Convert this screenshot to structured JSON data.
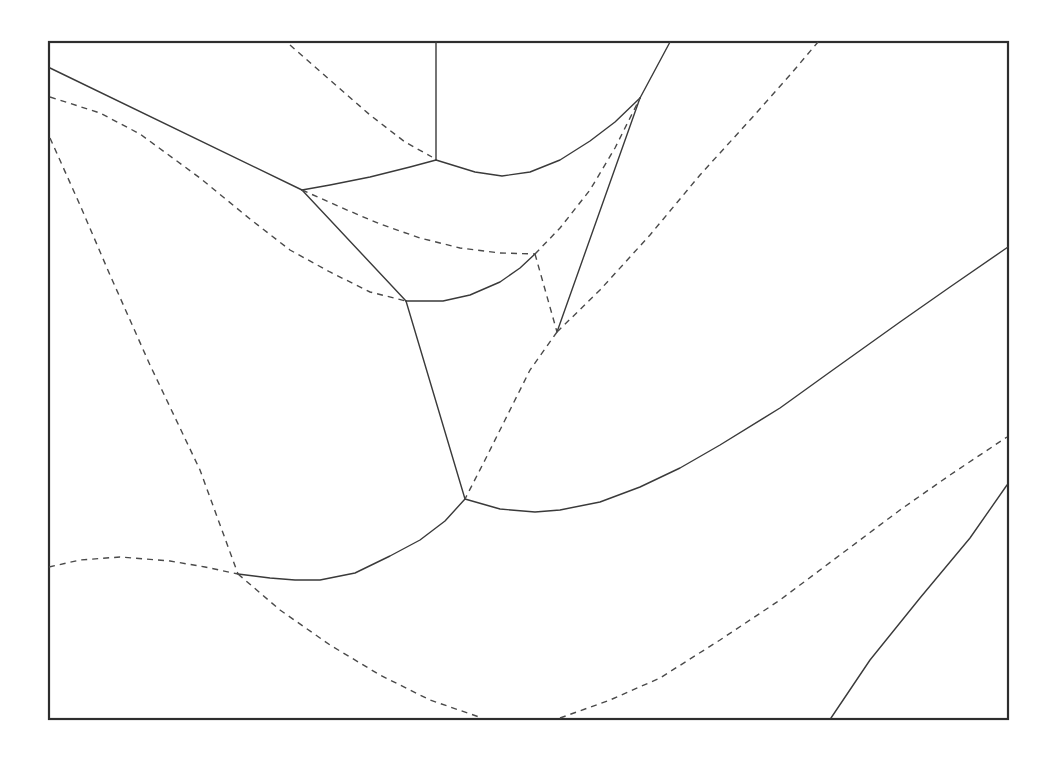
{
  "diagram": {
    "type": "voronoi-parabolic-diagram",
    "colors": {
      "background": "#ffffff",
      "line": "#3a3a3a",
      "frame": "#2e2e2e"
    },
    "frame": {
      "x": 49,
      "y": 42,
      "width": 959,
      "height": 677
    },
    "vertices": [
      {
        "id": "A",
        "x": 302,
        "y": 190
      },
      {
        "id": "B",
        "x": 406,
        "y": 301
      },
      {
        "id": "C",
        "x": 535,
        "y": 254
      },
      {
        "id": "D",
        "x": 557,
        "y": 332
      },
      {
        "id": "E",
        "x": 465,
        "y": 499
      },
      {
        "id": "F",
        "x": 238,
        "y": 574
      },
      {
        "id": "G",
        "x": 436,
        "y": 160
      },
      {
        "id": "H",
        "x": 640,
        "y": 98
      }
    ],
    "solid_edges": [
      {
        "name": "edge-left-to-A",
        "points": "50,68 302,190"
      },
      {
        "name": "edge-top-to-G",
        "points": "436,42 436,160"
      },
      {
        "name": "edge-A-to-G",
        "points": "302,190 330,185 370,177 410,167 436,160"
      },
      {
        "name": "edge-G-to-H",
        "points": "436,160 475,172 502,176 530,172 560,160 590,141 615,122 640,98"
      },
      {
        "name": "edge-H-to-top",
        "points": "640,98 670,42"
      },
      {
        "name": "edge-A-to-B",
        "points": "302,190 406,301"
      },
      {
        "name": "edge-B-to-C",
        "points": "406,301 443,301 470,295 500,282 520,268 535,254"
      },
      {
        "name": "edge-D-to-H",
        "points": "557,332 640,98"
      },
      {
        "name": "edge-B-to-E",
        "points": "406,301 465,499"
      },
      {
        "name": "edge-F-to-E",
        "points": "238,574 270,578 295,580 320,580 355,573 390,556 420,540 445,521 465,499"
      },
      {
        "name": "edge-E-to-right",
        "points": "465,499 500,509 535,512 560,510 600,502 640,487 680,468 720,445 780,408 830,372 900,322 950,287 1008,247"
      },
      {
        "name": "edge-bottom-right",
        "points": "831,718 870,660 920,598 970,538 1007,485"
      }
    ],
    "dashed_edges": [
      {
        "name": "dash-top-to-G",
        "points": "290,45 330,80 370,115 405,142 432,157"
      },
      {
        "name": "dash-left-to-B",
        "points": "50,97 100,113 140,134 200,178 250,219 290,250 330,272 370,292 406,301"
      },
      {
        "name": "dash-A-to-C",
        "points": "302,190 340,207 380,224 420,238 460,248 500,253 535,254"
      },
      {
        "name": "dash-C-to-H",
        "points": "535,254 560,228 590,190 615,148 640,98"
      },
      {
        "name": "dash-C-to-D",
        "points": "535,254 557,332"
      },
      {
        "name": "dash-D-to-top",
        "points": "557,332 600,290 650,235 700,175 750,120 790,75 818,42"
      },
      {
        "name": "dash-D-to-E",
        "points": "557,332 530,370 505,420 485,460 465,499"
      },
      {
        "name": "dash-left-to-F",
        "points": "50,138 80,205 110,275 150,365 200,470 238,574"
      },
      {
        "name": "dash-left-bottom-to-F",
        "points": "49,567 80,560 120,557 170,561 205,567 238,574"
      },
      {
        "name": "dash-F-to-bottom",
        "points": "238,574 280,610 330,645 380,675 430,700 482,718"
      },
      {
        "name": "dash-bottom-to-right",
        "points": "560,718 610,700 660,678 720,640 780,600 840,555 900,510 950,475 1007,437"
      }
    ]
  }
}
